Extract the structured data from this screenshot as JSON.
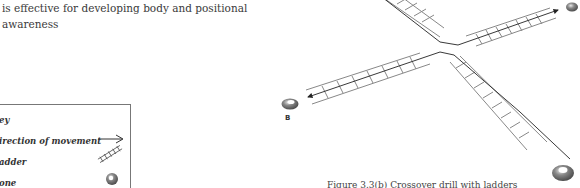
{
  "body_text": {
    "line1": "is effective for developing body and positional",
    "line2": "awareness"
  },
  "legend": {
    "title": "Key",
    "visible_title": "ey",
    "items": [
      {
        "label": "Direction of movement",
        "visible_label": "irection of movement",
        "icon": "arrow-icon"
      },
      {
        "label": "Ladder",
        "visible_label": "adder",
        "icon": "ladder-icon"
      },
      {
        "label": "Cone",
        "visible_label": "one",
        "icon": "cone-icon"
      }
    ]
  },
  "diagram": {
    "cone_labels": [
      "B"
    ],
    "line_color": "#333333",
    "ladder_color": "#888888",
    "cone_color": "#666666"
  },
  "caption": "Figure 3.3(b) Crossover drill with ladders"
}
